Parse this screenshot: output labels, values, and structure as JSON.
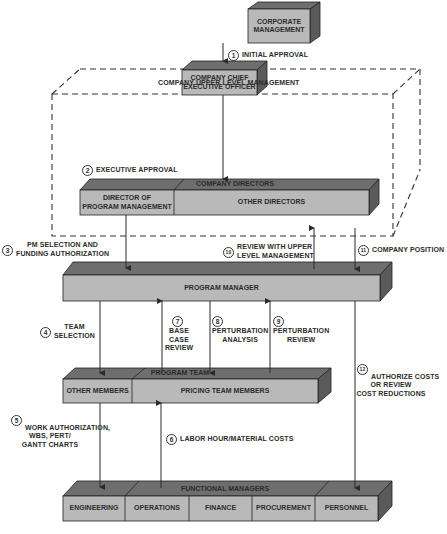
{
  "diagram": {
    "type": "organizational-flow",
    "colors": {
      "box_front": "#b9b9b9",
      "box_top": "#6e6e6e",
      "box_side": "#5a5a5a",
      "line": "#2a2a2a",
      "dashed_boundary": "#333333"
    },
    "boxes": {
      "corporate_management": "CORPORATE\nMANAGEMENT",
      "ceo": "COMPANY CHIEF\nEXECUTIVE OFFICER",
      "company_directors_title": "COMPANY DIRECTORS",
      "director_pm": "DIRECTOR OF\nPROGRAM MANAGEMENT",
      "other_directors": "OTHER DIRECTORS",
      "program_manager": "PROGRAM MANAGER",
      "program_team_title": "PROGRAM TEAM",
      "other_members": "OTHER MEMBERS",
      "pricing_team_members": "PRICING TEAM MEMBERS",
      "functional_managers_title": "FUNCTIONAL MANAGERS",
      "functional_units": [
        "ENGINEERING",
        "OPERATIONS",
        "FINANCE",
        "PROCUREMENT",
        "PERSONNEL"
      ]
    },
    "boundary_label": "COMPANY UPPER LEVEL MANAGEMENT",
    "steps": [
      {
        "num": "1",
        "label": "INITIAL APPROVAL"
      },
      {
        "num": "2",
        "label": "EXECUTIVE APPROVAL"
      },
      {
        "num": "3",
        "label_line1": "PM SELECTION AND",
        "label_line2": "FUNDING AUTHORIZATION"
      },
      {
        "num": "4",
        "label_line1": "TEAM",
        "label_line2": "SELECTION"
      },
      {
        "num": "5",
        "label_line1": "WORK AUTHORIZATION,",
        "label_line2": "WBS, PERT/",
        "label_line3": "GANTT CHARTS"
      },
      {
        "num": "6",
        "label": "LABOR HOUR/MATERIAL COSTS"
      },
      {
        "num": "7",
        "label_line1": "BASE",
        "label_line2": "CASE",
        "label_line3": "REVIEW"
      },
      {
        "num": "8",
        "label_line1": "PERTURBATION",
        "label_line2": "ANALYSIS"
      },
      {
        "num": "9",
        "label_line1": "PERTURBATION",
        "label_line2": "REVIEW"
      },
      {
        "num": "10",
        "label_line1": "REVIEW WITH UPPER",
        "label_line2": "LEVEL MANAGEMENT"
      },
      {
        "num": "11",
        "label": "COMPANY  POSITION"
      },
      {
        "num": "12",
        "label_line1": "AUTHORIZE COSTS",
        "label_line2": "OR REVIEW",
        "label_line3": "COST REDUCTIONS"
      }
    ]
  }
}
